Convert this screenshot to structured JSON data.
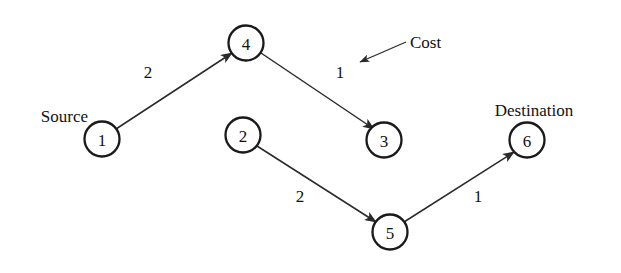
{
  "diagram": {
    "background_color": "#ffffff",
    "stroke_color": "#1a1a1a",
    "text_color": "#111111",
    "nodes": [
      {
        "id": "1",
        "label": "1",
        "cx": 102,
        "cy": 139,
        "r": 17.5
      },
      {
        "id": "4",
        "label": "4",
        "cx": 246,
        "cy": 43,
        "r": 17.5
      },
      {
        "id": "3",
        "label": "3",
        "cx": 384,
        "cy": 140,
        "r": 17.5
      },
      {
        "id": "2",
        "label": "2",
        "cx": 243,
        "cy": 135,
        "r": 17.5
      },
      {
        "id": "5",
        "label": "5",
        "cx": 390,
        "cy": 232,
        "r": 17.5
      },
      {
        "id": "6",
        "label": "6",
        "cx": 527,
        "cy": 140,
        "r": 17.5
      }
    ],
    "edges": [
      {
        "id": "e1",
        "from": "1",
        "to": "4",
        "weight": "2",
        "x1": 116,
        "y1": 129,
        "x2": 232,
        "y2": 53,
        "wx": 148,
        "wy": 72
      },
      {
        "id": "e2",
        "from": "4",
        "to": "3",
        "weight": "1",
        "x1": 261,
        "y1": 53,
        "x2": 374,
        "y2": 129,
        "wx": 340,
        "wy": 72
      },
      {
        "id": "e3",
        "from": "2",
        "to": "5",
        "weight": "2",
        "x1": 257,
        "y1": 146,
        "x2": 376,
        "y2": 222,
        "wx": 300,
        "wy": 196
      },
      {
        "id": "e4",
        "from": "5",
        "to": "6",
        "weight": "1",
        "x1": 404,
        "y1": 222,
        "x2": 514,
        "y2": 152,
        "wx": 478,
        "wy": 196
      }
    ],
    "annotation": {
      "id": "cost-annotation",
      "text": "Cost",
      "text_x": 410,
      "text_y": 42,
      "line_x1": 406,
      "line_y1": 42,
      "line_x2": 360,
      "line_y2": 62
    },
    "role_labels": [
      {
        "id": "source-label",
        "text": "Source",
        "x": 88,
        "y": 116,
        "anchor": "end"
      },
      {
        "id": "destination-label",
        "text": "Destination",
        "x": 534,
        "y": 110,
        "anchor": "middle"
      }
    ]
  }
}
